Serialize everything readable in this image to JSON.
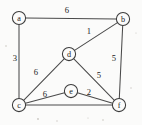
{
  "figure": {
    "kind": "weighted-undirected-graph",
    "width": 142,
    "height": 125,
    "background_color": "#fbfbfa",
    "node_fill_color": "#fbfbfa",
    "node_stroke_color": "#3b3b3b",
    "edge_color": "#4a4a4a",
    "text_color": "#1c1c1c",
    "node_radius": 6.6
  },
  "nodes": [
    {
      "id": "a",
      "label": "a",
      "x": 19,
      "y": 18
    },
    {
      "id": "b",
      "label": "b",
      "x": 123,
      "y": 19
    },
    {
      "id": "c",
      "label": "c",
      "x": 19,
      "y": 105
    },
    {
      "id": "d",
      "label": "d",
      "x": 69,
      "y": 54
    },
    {
      "id": "e",
      "label": "e",
      "x": 71,
      "y": 91
    },
    {
      "id": "f",
      "label": "f",
      "x": 119,
      "y": 105
    }
  ],
  "edges": [
    {
      "id": "a-b",
      "from": "a",
      "to": "b",
      "weight": "6",
      "label_x": 67,
      "label_y": 10
    },
    {
      "id": "a-c",
      "from": "a",
      "to": "c",
      "weight": "3",
      "label_x": 15,
      "label_y": 58
    },
    {
      "id": "b-d",
      "from": "b",
      "to": "d",
      "weight": "1",
      "label_x": 89,
      "label_y": 31
    },
    {
      "id": "b-f",
      "from": "b",
      "to": "f",
      "weight": "5",
      "label_x": 114,
      "label_y": 58
    },
    {
      "id": "c-d",
      "from": "c",
      "to": "d",
      "weight": "6",
      "label_x": 36,
      "label_y": 72
    },
    {
      "id": "d-f",
      "from": "d",
      "to": "f",
      "weight": "5",
      "label_x": 99,
      "label_y": 75
    },
    {
      "id": "c-e",
      "from": "c",
      "to": "e",
      "weight": "6",
      "label_x": 45,
      "label_y": 94
    },
    {
      "id": "e-f",
      "from": "e",
      "to": "f",
      "weight": "2",
      "label_x": 89,
      "label_y": 92
    },
    {
      "id": "c-f",
      "from": "c",
      "to": "f",
      "weight": "",
      "label_x": 0,
      "label_y": 0
    }
  ],
  "chart_data": {
    "type": "diagram",
    "title": "",
    "vertices": [
      "a",
      "b",
      "c",
      "d",
      "e",
      "f"
    ],
    "weighted_edges": [
      {
        "u": "a",
        "v": "b",
        "w": 6
      },
      {
        "u": "a",
        "v": "c",
        "w": 3
      },
      {
        "u": "b",
        "v": "d",
        "w": 1
      },
      {
        "u": "b",
        "v": "f",
        "w": 5
      },
      {
        "u": "c",
        "v": "d",
        "w": 6
      },
      {
        "u": "d",
        "v": "f",
        "w": 5
      },
      {
        "u": "c",
        "v": "e",
        "w": 6
      },
      {
        "u": "e",
        "v": "f",
        "w": 2
      },
      {
        "u": "c",
        "v": "f",
        "w": null
      }
    ]
  }
}
